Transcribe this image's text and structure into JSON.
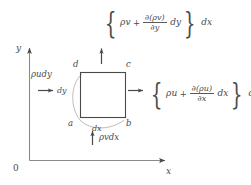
{
  "figure": {
    "background_color": "#ffffff",
    "line_color": "#5a5a5a",
    "text_color": "#4a4a4a"
  },
  "axes": {
    "origin_label": "0",
    "y_label": "y",
    "x_label": "x"
  },
  "control_volume": {
    "corner_a": "a",
    "corner_b": "b",
    "corner_c": "c",
    "corner_d": "d",
    "width_label": "dx",
    "height_label": "dy"
  },
  "fluxes": {
    "left": {
      "label": "ρudy"
    },
    "bottom": {
      "label": "ρvdx"
    },
    "top": {
      "term1": "ρv",
      "operator": "+",
      "numerator": "∂(ρv)",
      "denominator": "∂y",
      "differential": "dy",
      "multiplier": "dx"
    },
    "right": {
      "term1": "ρu",
      "operator": "+",
      "numerator": "∂(ρu)",
      "denominator": "∂x",
      "differential": "dx",
      "multiplier": "dy"
    }
  },
  "braces": {
    "open": "{",
    "close": "}"
  }
}
